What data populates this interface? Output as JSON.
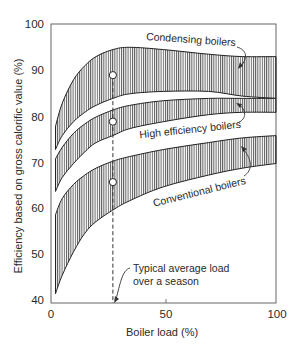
{
  "chart_data": {
    "type": "area",
    "title": "",
    "xlabel": "Boiler load (%)",
    "ylabel": "Efficiency based on gross calorific value (%)",
    "xlim": [
      0,
      100
    ],
    "ylim": [
      40,
      100
    ],
    "x_ticks": [
      0,
      50,
      100
    ],
    "y_ticks": [
      40,
      50,
      60,
      70,
      80,
      90,
      100
    ],
    "grid": false,
    "legend": "inline annotations",
    "series": [
      {
        "name": "Condensing boilers",
        "x": [
          2,
          5,
          10,
          15,
          20,
          27.5,
          35,
          50,
          70,
          85,
          100
        ],
        "upper": [
          78,
          83,
          88,
          91,
          93,
          94.5,
          95,
          94.5,
          93.5,
          93,
          93
        ],
        "lower": [
          73,
          76,
          79,
          81,
          82.5,
          84,
          85,
          85.5,
          85.5,
          84.5,
          84
        ]
      },
      {
        "name": "High efficiency boilers",
        "x": [
          2,
          5,
          10,
          15,
          20,
          27.5,
          35,
          50,
          70,
          85,
          100
        ],
        "upper": [
          71,
          73.5,
          76.5,
          78.5,
          80,
          81.5,
          82.5,
          83.5,
          84,
          84,
          84
        ],
        "lower": [
          64,
          67,
          70,
          72.5,
          74.5,
          76,
          77.5,
          79,
          80.5,
          81,
          81
        ]
      },
      {
        "name": "Conventional boilers",
        "x": [
          2,
          5,
          10,
          15,
          20,
          27.5,
          35,
          50,
          70,
          85,
          100
        ],
        "upper": [
          59,
          62.5,
          65.5,
          67.5,
          69,
          70.5,
          71.5,
          73,
          74.5,
          75.5,
          76
        ],
        "lower": [
          42,
          46,
          51,
          55,
          57.5,
          60,
          62,
          65,
          67.5,
          69,
          70
        ]
      }
    ],
    "markers": [
      {
        "x": 27.5,
        "y": 89,
        "series": "Condensing boilers"
      },
      {
        "x": 27.5,
        "y": 79,
        "series": "High efficiency boilers"
      },
      {
        "x": 27.5,
        "y": 66,
        "series": "Conventional boilers"
      }
    ],
    "reference_line": {
      "x": 27.5,
      "style": "dashed",
      "label": "Typical average load over a season"
    },
    "annotations": [
      "Condensing boilers",
      "High efficiency boilers",
      "Conventional boilers",
      "Typical average load over a season"
    ]
  },
  "labels": {
    "ylabel": "Efficiency based on gross calorific value (%)",
    "xlabel": "Boiler load (%)",
    "condensing": "Condensing  boilers",
    "high_eff": "High efficiency boilers",
    "conventional": "Conventional boilers",
    "typical_line1": "Typical average load",
    "typical_line2": "over a season",
    "ytick": [
      "100",
      "90",
      "80",
      "70",
      "60",
      "50",
      "40"
    ],
    "xtick": [
      "0",
      "50",
      "100"
    ]
  }
}
